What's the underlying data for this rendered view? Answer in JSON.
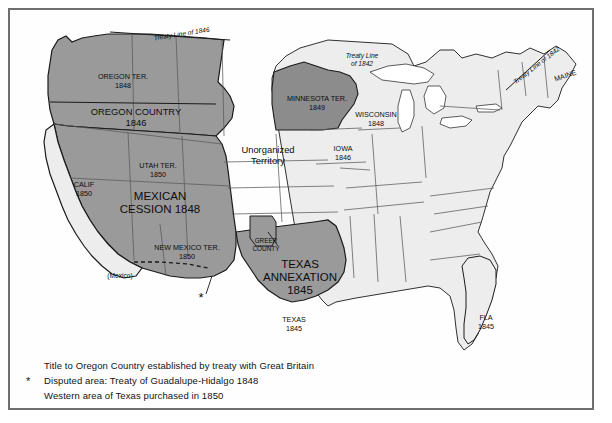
{
  "map": {
    "title_semantic": "united-states-territorial-acquisitions-map",
    "colors": {
      "frame": "#6f6f6f",
      "background": "#fefefe",
      "acquired_fill": "#9a9a9a",
      "acquired_fill_dark": "#8c8c8c",
      "state_fill": "#ededed",
      "mexico_fill": "#ffffff",
      "outline": "#1a1a1a",
      "internal_border": "#5a5a5a",
      "text": "#0d0d0d"
    },
    "labels": [
      {
        "id": "treaty-line-1846",
        "lines": [
          "Treaty Line of 1846"
        ],
        "x": 172,
        "y": 26,
        "rotate": -9,
        "style": "treaty"
      },
      {
        "id": "treaty-line-1842-midwest",
        "lines": [
          "Treaty Line",
          "of  1842"
        ],
        "x": 352,
        "y": 48,
        "rotate": 0,
        "style": "treaty"
      },
      {
        "id": "treaty-line-1842-maine",
        "lines": [
          "Treaty Line of 1842"
        ],
        "x": 528,
        "y": 57,
        "rotate": -38,
        "style": "treaty"
      },
      {
        "id": "oregon-territory",
        "lines": [
          "OREGON TER.",
          "1848"
        ],
        "x": 113,
        "y": 69,
        "rotate": 0,
        "style": "lbl"
      },
      {
        "id": "oregon-country",
        "lines": [
          "OREGON COUNTRY",
          "1846"
        ],
        "x": 126,
        "y": 105,
        "rotate": 0,
        "style": "lbl-mid"
      },
      {
        "id": "minnesota-territory",
        "lines": [
          "MINNESOTA TER.",
          "1849"
        ],
        "x": 307,
        "y": 91,
        "rotate": 0,
        "style": "lbl"
      },
      {
        "id": "wisconsin",
        "lines": [
          "WISCONSIN",
          "1848"
        ],
        "x": 366,
        "y": 107,
        "rotate": 0,
        "style": "lbl"
      },
      {
        "id": "iowa",
        "lines": [
          "IOWA",
          "1846"
        ],
        "x": 333,
        "y": 141,
        "rotate": 0,
        "style": "lbl"
      },
      {
        "id": "maine",
        "lines": [
          "MAINE"
        ],
        "x": 556,
        "y": 68,
        "rotate": -18,
        "style": "lbl"
      },
      {
        "id": "unorganized-territory",
        "lines": [
          "Unorganized",
          "Territory"
        ],
        "x": 258,
        "y": 143,
        "rotate": 0,
        "style": "lbl-mid"
      },
      {
        "id": "utah-territory",
        "lines": [
          "UTAH TER.",
          "1850"
        ],
        "x": 148,
        "y": 158,
        "rotate": 0,
        "style": "lbl"
      },
      {
        "id": "california",
        "lines": [
          "CALIF",
          "1850"
        ],
        "x": 74,
        "y": 177,
        "rotate": 0,
        "style": "lbl"
      },
      {
        "id": "mexican-cession",
        "lines": [
          "MEXICAN",
          "CESSION 1848"
        ],
        "x": 150,
        "y": 190,
        "rotate": 0,
        "style": "lbl-big"
      },
      {
        "id": "new-mexico-territory",
        "lines": [
          "NEW MEXICO TER.",
          "1850"
        ],
        "x": 177,
        "y": 240,
        "rotate": 0,
        "style": "lbl"
      },
      {
        "id": "greer-county",
        "lines": [
          "GREER",
          "COUNTY"
        ],
        "x": 256,
        "y": 233,
        "rotate": 0,
        "style": "lbl-sm"
      },
      {
        "id": "texas-annexation",
        "lines": [
          "TEXAS",
          "ANNEXATION",
          "1845"
        ],
        "x": 290,
        "y": 258,
        "rotate": 0,
        "style": "lbl-big"
      },
      {
        "id": "mexico",
        "lines": [
          "(Mexico)"
        ],
        "x": 110,
        "y": 268,
        "rotate": 0,
        "style": "paren"
      },
      {
        "id": "texas",
        "lines": [
          "TEXAS",
          "1845"
        ],
        "x": 284,
        "y": 312,
        "rotate": 0,
        "style": "lbl"
      },
      {
        "id": "florida",
        "lines": [
          "FLA",
          "1845"
        ],
        "x": 476,
        "y": 310,
        "rotate": 0,
        "style": "lbl"
      }
    ],
    "disputed_marker": {
      "id": "disputed-area-asterisk",
      "symbol": "*",
      "x": 191,
      "y": 290
    }
  },
  "legend": {
    "rows": [
      {
        "id": "legend-oregon-title",
        "star": "",
        "text": "Title to Oregon Country established by treaty with Great Britain"
      },
      {
        "id": "legend-disputed-area",
        "star": "*",
        "text": "Disputed area: Treaty of Guadalupe-Hidalgo 1848"
      },
      {
        "id": "legend-western-texas",
        "star": "",
        "text": "Western area of Texas purchased in 1850"
      }
    ]
  }
}
